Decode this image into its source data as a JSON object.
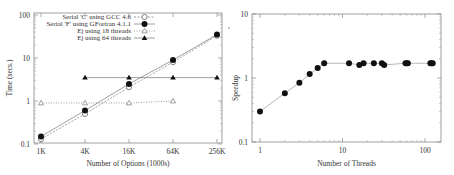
{
  "chart_data": [
    {
      "type": "line",
      "title": "",
      "xlabel": "Number of Options (1000s)",
      "ylabel": "Time (secs.)",
      "x_scale": "log2",
      "y_scale": "log10",
      "categories": [
        "1K",
        "4K",
        "16K",
        "64K",
        "256K"
      ],
      "x": [
        1,
        4,
        16,
        64,
        256
      ],
      "ylim": [
        0.1,
        100
      ],
      "yticks": [
        "0.1",
        "1",
        "10",
        "100"
      ],
      "grid": false,
      "legend_position": "top-left-inside",
      "series": [
        {
          "name": "Serial 'C' using GCC 4.6",
          "marker": "open-circle",
          "line": "dashed",
          "x": [
            1,
            4,
            16,
            64,
            256
          ],
          "values": [
            0.13,
            0.5,
            2.1,
            8,
            33
          ]
        },
        {
          "name": "Serial 'F' using GFortran 4.1.1",
          "marker": "filled-circle",
          "line": "solid",
          "x": [
            1,
            4,
            16,
            64,
            256
          ],
          "values": [
            0.15,
            0.6,
            2.5,
            9,
            35
          ]
        },
        {
          "name": "Ej using 18 threads",
          "marker": "open-triangle",
          "line": "dotted",
          "x": [
            1,
            4,
            16,
            64
          ],
          "values": [
            0.9,
            0.9,
            0.9,
            1.0
          ]
        },
        {
          "name": "Ej using 64 threads",
          "marker": "filled-triangle",
          "line": "solid",
          "x": [
            4,
            16,
            64,
            256
          ],
          "values": [
            3.5,
            3.5,
            3.5,
            3.5
          ]
        }
      ]
    },
    {
      "type": "line",
      "title": "",
      "xlabel": "Number of Threads",
      "ylabel": "Speedup",
      "x_scale": "log10",
      "y_scale": "log10",
      "xticks": [
        "1",
        "10",
        "100"
      ],
      "yticks": [
        "0.1",
        "1",
        "10"
      ],
      "xlim": [
        0.8,
        150
      ],
      "ylim": [
        0.1,
        10
      ],
      "grid": false,
      "series": [
        {
          "name": "Speedup",
          "marker": "filled-circle",
          "line": "solid",
          "x": [
            1,
            2,
            3,
            4,
            5,
            6,
            12,
            16,
            18,
            24,
            30,
            32,
            58,
            60,
            62,
            116,
            120,
            124
          ],
          "values": [
            0.3,
            0.58,
            0.84,
            1.15,
            1.43,
            1.7,
            1.7,
            1.6,
            1.7,
            1.7,
            1.7,
            1.6,
            1.7,
            1.7,
            1.7,
            1.7,
            1.7,
            1.7
          ]
        }
      ]
    }
  ]
}
